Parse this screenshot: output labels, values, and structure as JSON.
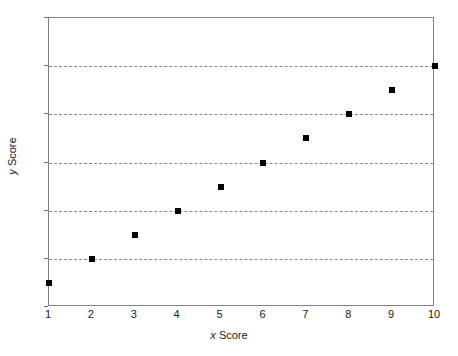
{
  "chart_data": {
    "type": "scatter",
    "title": "",
    "xlabel": "x Score",
    "xlabel_var": "x",
    "xlabel_rest": " Score",
    "ylabel": "y Score",
    "ylabel_var": "y",
    "ylabel_rest": " Score",
    "x": [
      1,
      2,
      3,
      4,
      5,
      6,
      7,
      8,
      9,
      10
    ],
    "values": [
      1,
      2,
      3,
      4,
      5,
      6,
      7,
      8,
      9,
      10
    ],
    "series": [
      {
        "name": "scores",
        "points": [
          {
            "x": 1,
            "y": 1
          },
          {
            "x": 2,
            "y": 2
          },
          {
            "x": 3,
            "y": 3
          },
          {
            "x": 4,
            "y": 4
          },
          {
            "x": 5,
            "y": 5
          },
          {
            "x": 6,
            "y": 6
          },
          {
            "x": 7,
            "y": 7
          },
          {
            "x": 8,
            "y": 8
          },
          {
            "x": 9,
            "y": 9
          },
          {
            "x": 10,
            "y": 10
          }
        ],
        "marker": "filled-square",
        "marker_color": "#000000",
        "marker_size": 6
      }
    ],
    "xlim": [
      1,
      10
    ],
    "ylim": [
      0,
      12
    ],
    "x_ticks": [
      1,
      2,
      3,
      4,
      5,
      6,
      7,
      8,
      9,
      10
    ],
    "x_tick_labels": [
      "1",
      "2",
      "3",
      "4",
      "5",
      "6",
      "7",
      "8",
      "9",
      "10"
    ],
    "y_ticks": [
      0,
      2,
      4,
      6,
      8,
      10,
      12
    ],
    "y_tick_labels": [
      "0",
      "2",
      "4",
      "6",
      "8",
      "10",
      "12"
    ],
    "gridlines_y": [
      2,
      4,
      6,
      8,
      10
    ],
    "grid": true,
    "grid_axis": "y",
    "grid_style": "dashed",
    "grid_color": "#888888",
    "legend": false,
    "legend_position": "none",
    "frame_color": "#808080",
    "background_color": "#ffffff"
  }
}
